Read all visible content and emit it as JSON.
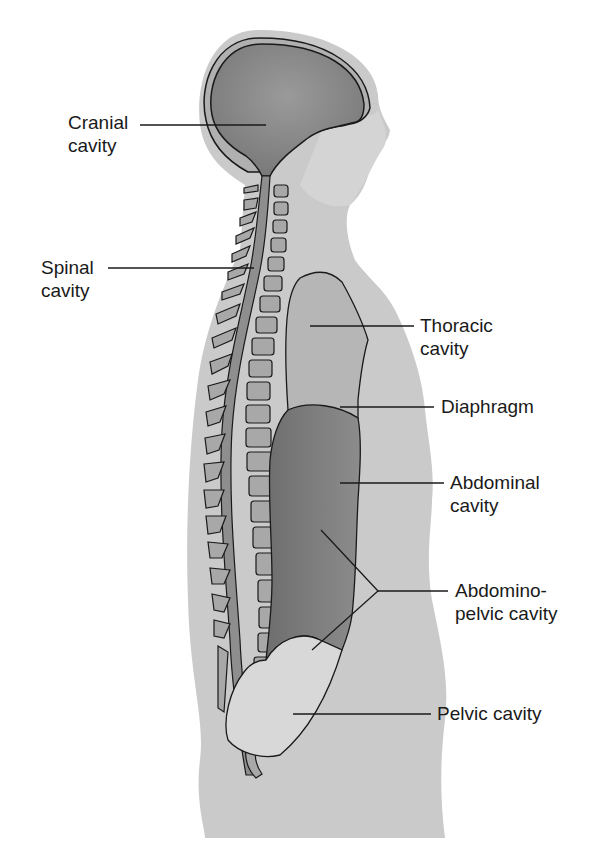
{
  "diagram": {
    "type": "anatomical-sagittal-section",
    "colors": {
      "background": "#ffffff",
      "body": "#c9c9c9",
      "body_light": "#d8d8d8",
      "cranial_cavity": "#8a8a8a",
      "thoracic_cavity": "#b4b4b4",
      "abdominal_cavity": "#7e7e7e",
      "pelvic_cavity": "#d6d6d6",
      "vertebra": "#a8a8a8",
      "outline": "#1a1a1a",
      "label_text": "#1a1a1a"
    },
    "labels": [
      {
        "id": "cranial",
        "text": "Cranial\ncavity"
      },
      {
        "id": "spinal",
        "text": "Spinal\ncavity"
      },
      {
        "id": "thoracic",
        "text": "Thoracic\ncavity"
      },
      {
        "id": "diaphragm",
        "text": "Diaphragm"
      },
      {
        "id": "abdominal",
        "text": "Abdominal\ncavity"
      },
      {
        "id": "abdominopelvic",
        "text": "Abdomino-\npelvic cavity"
      },
      {
        "id": "pelvic",
        "text": "Pelvic cavity"
      }
    ]
  }
}
